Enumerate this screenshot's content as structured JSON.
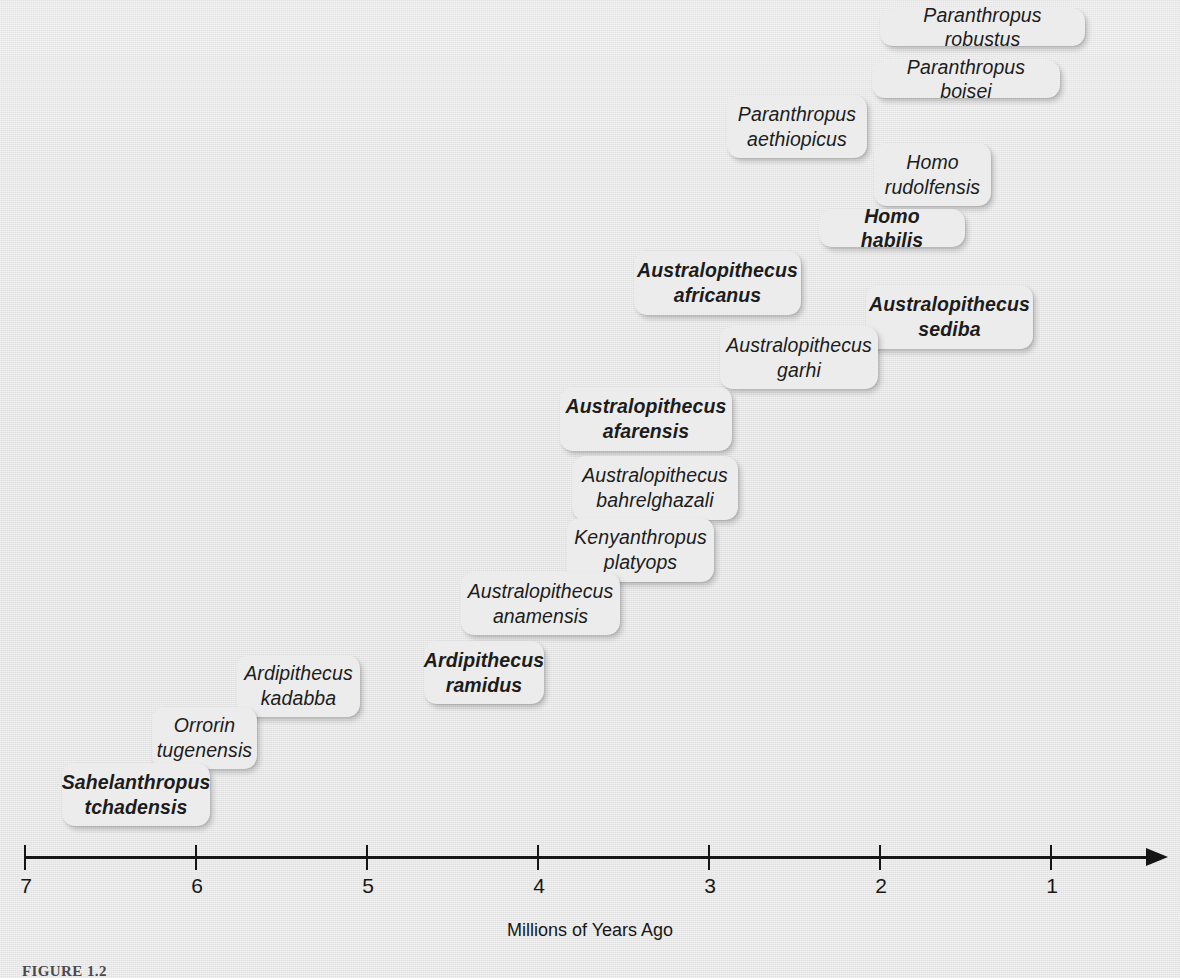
{
  "figure": {
    "caption_label": "FIGURE 1.2",
    "axis_title": "Millions of Years Ago"
  },
  "axis": {
    "ticks": [
      {
        "value": "7",
        "label": "7"
      },
      {
        "value": "6",
        "label": "6"
      },
      {
        "value": "5",
        "label": "5"
      },
      {
        "value": "4",
        "label": "4"
      },
      {
        "value": "3",
        "label": "3"
      },
      {
        "value": "2",
        "label": "2"
      },
      {
        "value": "1",
        "label": "1"
      }
    ],
    "arrow": "right-arrow-icon"
  },
  "colors": {
    "background": "#e4e4e4",
    "chip_fill": "#ececec",
    "text": "#1c1c1c",
    "axis": "#151515"
  },
  "chart_data": {
    "type": "timeline",
    "title": "",
    "xlabel": "Millions of Years Ago",
    "ylabel": "",
    "xlim": [
      7,
      0.5
    ],
    "x_direction": "decreasing",
    "grid": false,
    "legend": null,
    "tick_labels": [
      "7",
      "6",
      "5",
      "4",
      "3",
      "2",
      "1"
    ],
    "note": "Each species is drawn as a rounded label chip positioned along a reversed time axis; bold chips mark emphasized taxa.",
    "species": [
      {
        "name": "Sahelanthropus tchadensis",
        "lines": [
          "Sahelanthropus",
          "tchadensis"
        ],
        "bold": true,
        "approx_mya": 6.9
      },
      {
        "name": "Orrorin tugenensis",
        "lines": [
          "Orrorin",
          "tugenensis"
        ],
        "bold": false,
        "approx_mya": 6.1
      },
      {
        "name": "Ardipithecus kadabba",
        "lines": [
          "Ardipithecus",
          "kadabba"
        ],
        "bold": false,
        "approx_mya": 5.6
      },
      {
        "name": "Ardipithecus ramidus",
        "lines": [
          "Ardipithecus",
          "ramidus"
        ],
        "bold": true,
        "approx_mya": 4.5
      },
      {
        "name": "Australopithecus anamensis",
        "lines": [
          "Australopithecus",
          "anamensis"
        ],
        "bold": false,
        "approx_mya": 4.3
      },
      {
        "name": "Kenyanthropus platyops",
        "lines": [
          "Kenyanthropus",
          "platyops"
        ],
        "bold": false,
        "approx_mya": 3.6
      },
      {
        "name": "Australopithecus bahrelghazali",
        "lines": [
          "Australopithecus",
          "bahrelghazali"
        ],
        "bold": false,
        "approx_mya": 3.6
      },
      {
        "name": "Australopithecus afarensis",
        "lines": [
          "Australopithecus",
          "afarensis"
        ],
        "bold": true,
        "approx_mya": 3.6
      },
      {
        "name": "Australopithecus garhi",
        "lines": [
          "Australopithecus",
          "garhi"
        ],
        "bold": false,
        "approx_mya": 2.9
      },
      {
        "name": "Australopithecus sediba",
        "lines": [
          "Australopithecus",
          "sediba"
        ],
        "bold": true,
        "approx_mya": 2.0
      },
      {
        "name": "Australopithecus africanus",
        "lines": [
          "Australopithecus",
          "africanus"
        ],
        "bold": true,
        "approx_mya": 3.2
      },
      {
        "name": "Homo habilis",
        "lines": [
          "Homo habilis"
        ],
        "bold": true,
        "approx_mya": 2.1
      },
      {
        "name": "Homo rudolfensis",
        "lines": [
          "Homo",
          "rudolfensis"
        ],
        "bold": false,
        "approx_mya": 1.9
      },
      {
        "name": "Paranthropus aethiopicus",
        "lines": [
          "Paranthropus",
          "aethiopicus"
        ],
        "bold": false,
        "approx_mya": 2.6
      },
      {
        "name": "Paranthropus boisei",
        "lines": [
          "Paranthropus boisei"
        ],
        "bold": false,
        "approx_mya": 1.8
      },
      {
        "name": "Paranthropus robustus",
        "lines": [
          "Paranthropus robustus"
        ],
        "bold": false,
        "approx_mya": 1.6
      }
    ]
  },
  "chips": [
    {
      "key": "paranthropus-robustus",
      "text": "Paranthropus robustus",
      "bold": false,
      "x": 880,
      "y": 8,
      "w": 205,
      "h": 38,
      "lines": 1
    },
    {
      "key": "paranthropus-boisei",
      "text": "Paranthropus boisei",
      "bold": false,
      "x": 872,
      "y": 60,
      "w": 188,
      "h": 38,
      "lines": 1
    },
    {
      "key": "paranthropus-aethiopicus",
      "text": "Paranthropus\naethiopicus",
      "bold": false,
      "x": 727,
      "y": 95,
      "w": 140,
      "h": 63,
      "lines": 2
    },
    {
      "key": "homo-rudolfensis",
      "text": "Homo\nrudolfensis",
      "bold": false,
      "x": 874,
      "y": 143,
      "w": 117,
      "h": 63,
      "lines": 2
    },
    {
      "key": "homo-habilis",
      "text": "Homo habilis",
      "bold": true,
      "x": 819,
      "y": 209,
      "w": 146,
      "h": 38,
      "lines": 1
    },
    {
      "key": "australopithecus-africanus",
      "text": "Australopithecus\nafricanus",
      "bold": true,
      "x": 634,
      "y": 251,
      "w": 167,
      "h": 64,
      "lines": 2
    },
    {
      "key": "australopithecus-sediba",
      "text": "Australopithecus\nsediba",
      "bold": true,
      "x": 866,
      "y": 285,
      "w": 167,
      "h": 64,
      "lines": 2
    },
    {
      "key": "australopithecus-garhi",
      "text": "Australopithecus\ngarhi",
      "bold": false,
      "x": 720,
      "y": 326,
      "w": 158,
      "h": 63,
      "lines": 2
    },
    {
      "key": "australopithecus-afarensis",
      "text": "Australopithecus\nafarensis",
      "bold": true,
      "x": 560,
      "y": 387,
      "w": 172,
      "h": 64,
      "lines": 2
    },
    {
      "key": "australopithecus-bahrelghazali",
      "text": "Australopithecus\nbahrelghazali",
      "bold": false,
      "x": 572,
      "y": 456,
      "w": 166,
      "h": 64,
      "lines": 2
    },
    {
      "key": "kenyanthropus-platyops",
      "text": "Kenyanthropus\nplatyops",
      "bold": false,
      "x": 567,
      "y": 518,
      "w": 147,
      "h": 64,
      "lines": 2
    },
    {
      "key": "australopithecus-anamensis",
      "text": "Australopithecus\nanamensis",
      "bold": false,
      "x": 461,
      "y": 572,
      "w": 159,
      "h": 63,
      "lines": 2
    },
    {
      "key": "ardipithecus-ramidus",
      "text": "Ardipithecus\nramidus",
      "bold": true,
      "x": 424,
      "y": 641,
      "w": 120,
      "h": 63,
      "lines": 2
    },
    {
      "key": "ardipithecus-kadabba",
      "text": "Ardipithecus\nkadabba",
      "bold": false,
      "x": 237,
      "y": 655,
      "w": 123,
      "h": 62,
      "lines": 2
    },
    {
      "key": "orrorin-tugenensis",
      "text": "Orrorin\ntugenensis",
      "bold": false,
      "x": 152,
      "y": 707,
      "w": 105,
      "h": 62,
      "lines": 2
    },
    {
      "key": "sahelanthropus-tchadensis",
      "text": "Sahelanthropus\ntchadensis",
      "bold": true,
      "x": 62,
      "y": 763,
      "w": 148,
      "h": 63,
      "lines": 2
    }
  ]
}
